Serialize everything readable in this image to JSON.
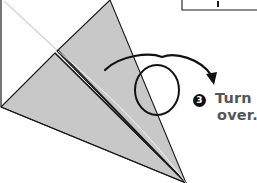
{
  "diagram": {
    "type": "origami-instruction",
    "colors": {
      "paper_fill": "#c8c8c8",
      "line": "#1a1a1a",
      "faint_crease": "#d4d4d4",
      "text": "#555555",
      "badge_bg": "#111111",
      "badge_fg": "#ffffff"
    }
  },
  "step": {
    "number": "3",
    "line1": "Turn",
    "line2": "over."
  },
  "icons": {
    "turn_over_arrow": "turn-over-arrow-icon"
  }
}
